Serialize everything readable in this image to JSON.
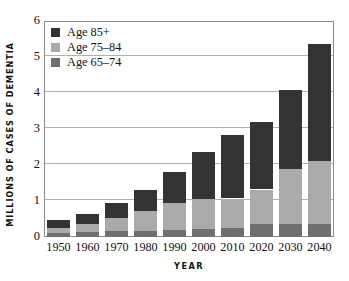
{
  "chart_data": {
    "type": "bar",
    "stacked": true,
    "title": "",
    "xlabel": "YEAR",
    "ylabel": "MILLIONS OF CASES OF DEMENTIA",
    "categories": [
      "1950",
      "1960",
      "1970",
      "1980",
      "1990",
      "2000",
      "2010",
      "2020",
      "2030",
      "2040"
    ],
    "series": [
      {
        "name": "Age 65–74",
        "color": "#6f6f6f",
        "values": [
          0.1,
          0.14,
          0.16,
          0.18,
          0.2,
          0.22,
          0.24,
          0.35,
          0.35,
          0.35
        ]
      },
      {
        "name": "Age 75–84",
        "color": "#aaaaaa",
        "values": [
          0.16,
          0.23,
          0.36,
          0.54,
          0.75,
          0.83,
          0.83,
          0.97,
          1.53,
          1.75
        ]
      },
      {
        "name": "Age 85+",
        "color": "#333333",
        "values": [
          0.2,
          0.28,
          0.42,
          0.6,
          0.87,
          1.3,
          1.75,
          1.88,
          2.2,
          3.25
        ]
      }
    ],
    "totals": [
      0.46,
      0.65,
      0.94,
      1.32,
      1.82,
      2.35,
      2.82,
      3.2,
      4.08,
      5.35
    ],
    "ylim": [
      0,
      6
    ],
    "yticks": [
      "0",
      "1",
      "2",
      "3",
      "4",
      "5",
      "6"
    ],
    "grid": true,
    "legend_position": "top-left"
  },
  "legend": {
    "entries": [
      {
        "label": "Age 85+",
        "color": "#333333"
      },
      {
        "label": "Age 75–84",
        "color": "#aaaaaa"
      },
      {
        "label": "Age 65–74",
        "color": "#6f6f6f"
      }
    ]
  }
}
